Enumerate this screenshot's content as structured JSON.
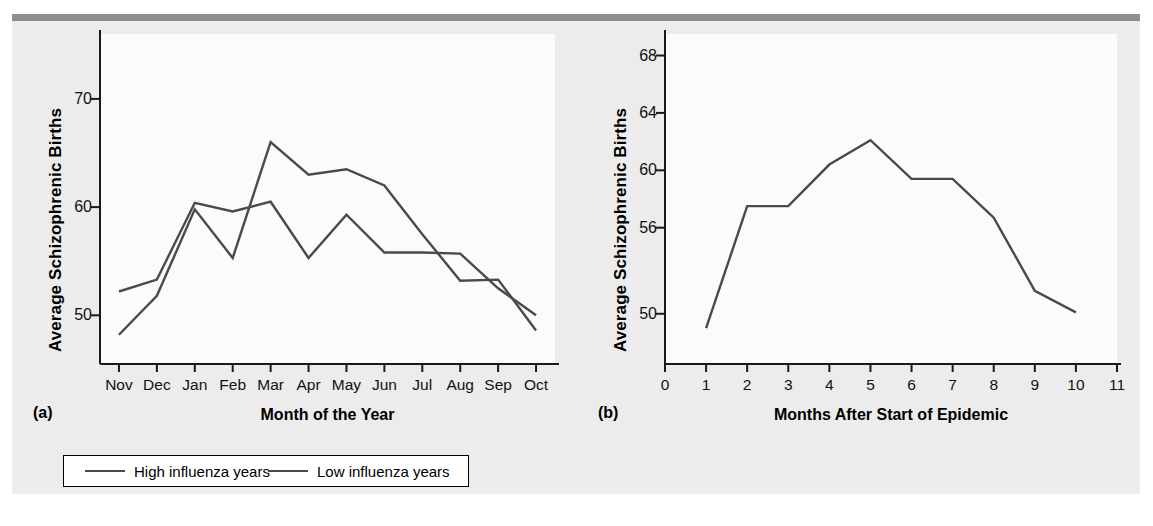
{
  "figure": {
    "background_color": "#ececec",
    "rule_color": "#8d8d8d",
    "line_color": "#4a4a4a",
    "panel_letters": {
      "a": "(a)",
      "b": "(b)"
    }
  },
  "legend": {
    "entries": [
      {
        "label": "High influenza years",
        "color": "#4a4a4a"
      },
      {
        "label": "Low influenza years",
        "color": "#4a4a4a"
      }
    ]
  },
  "chart_data": [
    {
      "type": "line",
      "panel": "(a)",
      "title": "",
      "xlabel": "Month of the Year",
      "ylabel": "Average Schizophrenic Births",
      "categories": [
        "Nov",
        "Dec",
        "Jan",
        "Feb",
        "Mar",
        "Apr",
        "May",
        "Jun",
        "Jul",
        "Aug",
        "Sep",
        "Oct"
      ],
      "ytick_labels": [
        "50",
        "60",
        "70"
      ],
      "yticks": [
        50,
        60,
        70
      ],
      "ylim": [
        45.5,
        76.0
      ],
      "grid": false,
      "legend_position": "below-figure",
      "series": [
        {
          "name": "High influenza years",
          "color": "#4a4a4a",
          "values": [
            48.2,
            51.8,
            59.8,
            55.3,
            66.0,
            63.0,
            63.5,
            62.0,
            57.5,
            53.2,
            53.3,
            48.6
          ]
        },
        {
          "name": "Low influenza years",
          "color": "#4a4a4a",
          "values": [
            52.2,
            53.3,
            60.4,
            59.6,
            60.5,
            55.3,
            59.3,
            55.8,
            55.8,
            55.7,
            52.5,
            50.0
          ]
        }
      ]
    },
    {
      "type": "line",
      "panel": "(b)",
      "title": "",
      "xlabel": "Months After Start of Epidemic",
      "ylabel": "Average Schizophrenic Births",
      "x": [
        1,
        2,
        3,
        4,
        5,
        6,
        7,
        8,
        9,
        10
      ],
      "xtick_labels": [
        "0",
        "1",
        "2",
        "3",
        "4",
        "5",
        "6",
        "7",
        "8",
        "9",
        "10",
        "11"
      ],
      "xticks": [
        0,
        1,
        2,
        3,
        4,
        5,
        6,
        7,
        8,
        9,
        10,
        11
      ],
      "xlim": [
        0,
        11
      ],
      "ytick_labels": [
        "50",
        "56",
        "60",
        "64",
        "68"
      ],
      "yticks": [
        50,
        56,
        60,
        64,
        68
      ],
      "ylim": [
        46.5,
        69.5
      ],
      "grid": false,
      "series": [
        {
          "name": "Schizophrenic births after epidemic",
          "color": "#4a4a4a",
          "values": [
            49.0,
            57.5,
            57.5,
            60.4,
            62.1,
            59.4,
            59.4,
            56.7,
            51.6,
            50.1
          ]
        }
      ]
    }
  ]
}
